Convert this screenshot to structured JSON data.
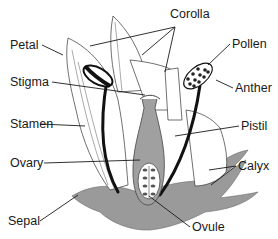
{
  "diagram": {
    "type": "labeled-illustration",
    "colors": {
      "background": "#ffffff",
      "outline": "#1a1a1a",
      "petal_fill": "#ffffff",
      "sepal_fill": "#9a9a9a",
      "pistil_fill": "#a0a0a0",
      "label_text": "#1a1a1a"
    },
    "labels": {
      "corolla": "Corolla",
      "petal": "Petal",
      "pollen": "Pollen",
      "stigma": "Stigma",
      "anther": "Anther",
      "stamen": "Stamen",
      "pistil": "Pistil",
      "ovary": "Ovary",
      "calyx": "Calyx",
      "sepal": "Sepal",
      "ovule": "Ovule"
    }
  }
}
